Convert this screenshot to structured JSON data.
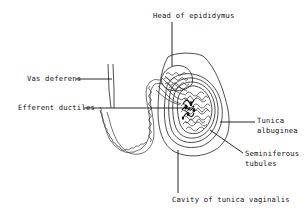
{
  "diagram": {
    "labels": {
      "head_of_epididymus": "Head of epididymus",
      "vas_deferens": "Vas deferens",
      "efferent_ductiles": "Efferent ductiles",
      "tunica_albuginea_line1": "Tunica",
      "tunica_albuginea_line2": "albuginea",
      "seminiferous_line1": "Seminiferous",
      "seminiferous_line2": "tubules",
      "cavity_tunica_vaginalis": "Cavity of tunica vaginalis"
    },
    "colors": {
      "ink": "#111111",
      "background": "#ffffff"
    }
  }
}
